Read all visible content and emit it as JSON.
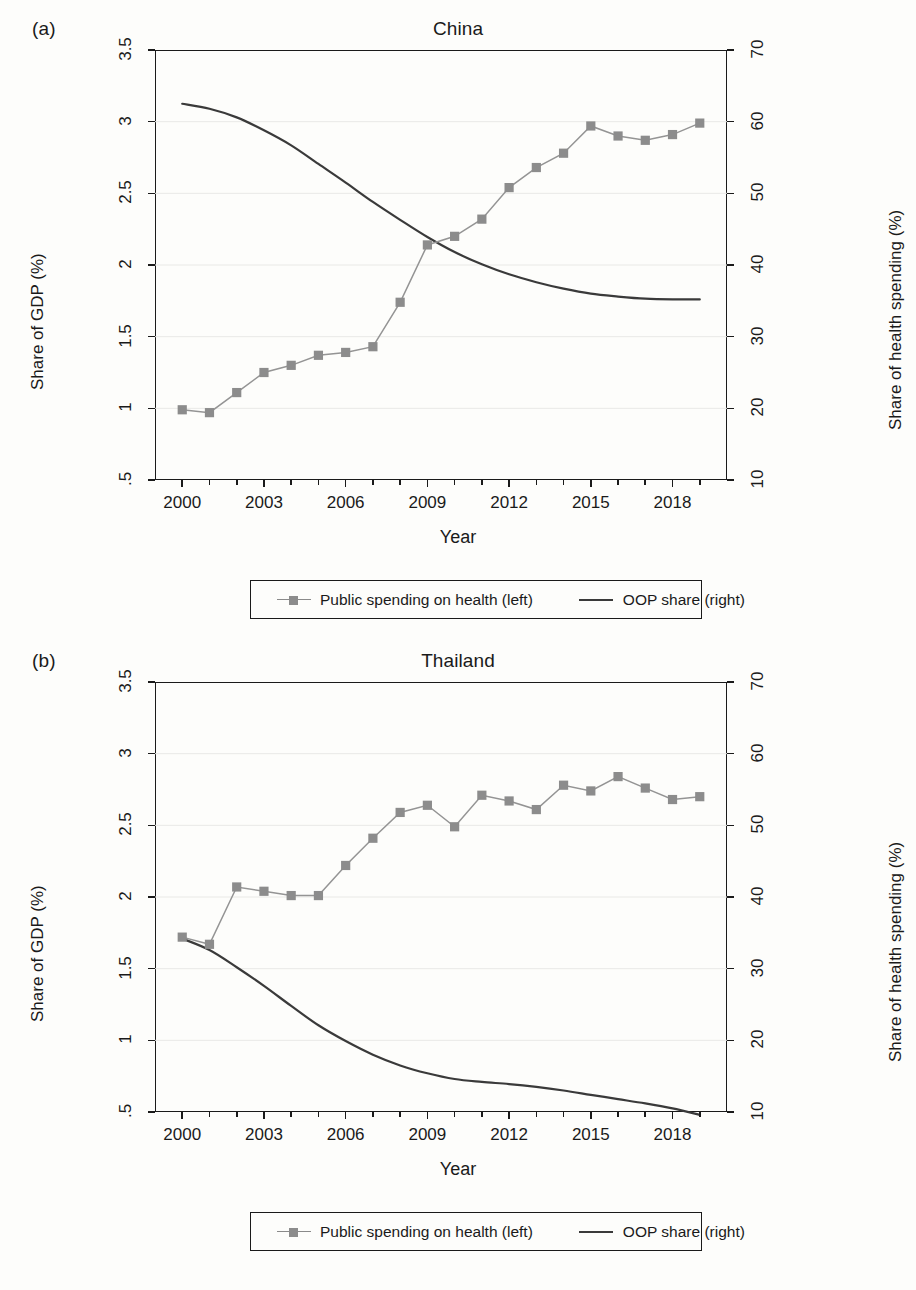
{
  "figure": {
    "panels": [
      {
        "letter": "(a)",
        "title": "China",
        "xlabel": "Year",
        "ylabel_left": "Share of GDP (%)",
        "ylabel_right": "Share of health spending (%)"
      },
      {
        "letter": "(b)",
        "title": "Thailand",
        "xlabel": "Year",
        "ylabel_left": "Share of GDP (%)",
        "ylabel_right": "Share of health spending (%)"
      }
    ],
    "legend": {
      "series1_label": "Public spending on health (left)",
      "series2_label": "OOP share (right)"
    },
    "colors": {
      "marker": "#8c8c8c",
      "series1_line": "#949494",
      "series2_line": "#3a3a3a",
      "axis": "#1a1a1a",
      "grid": "#e9e9e6"
    }
  },
  "chart_data": [
    {
      "type": "line",
      "title": "China",
      "panel": "(a)",
      "xlabel": "Year",
      "ylabel": "Share of GDP (%)",
      "ylabel_right": "Share of health spending (%)",
      "xlim": [
        1999,
        2020
      ],
      "ylim_left": [
        0.5,
        3.5
      ],
      "ylim_right": [
        10,
        70
      ],
      "ytick_labels_left": [
        "3.5",
        "3",
        "2.5",
        "2",
        "1.5",
        "1",
        ".5"
      ],
      "ytick_values_left": [
        3.5,
        3,
        2.5,
        2,
        1.5,
        1,
        0.5
      ],
      "ytick_labels_right": [
        "70",
        "60",
        "50",
        "40",
        "30",
        "20",
        "10"
      ],
      "ytick_values_right": [
        70,
        60,
        50,
        40,
        30,
        20,
        10
      ],
      "xtick_labels": [
        "2000",
        "2003",
        "2006",
        "2009",
        "2012",
        "2015",
        "2018"
      ],
      "xtick_values": [
        2000,
        2003,
        2006,
        2009,
        2012,
        2015,
        2018
      ],
      "grid": "horizontal",
      "legend_position": "below",
      "x": [
        2000,
        2001,
        2002,
        2003,
        2004,
        2005,
        2006,
        2007,
        2008,
        2009,
        2010,
        2011,
        2012,
        2013,
        2014,
        2015,
        2016,
        2017,
        2018,
        2019
      ],
      "series": [
        {
          "name": "Public spending on health (left)",
          "axis": "left",
          "marker": "square",
          "values": [
            0.99,
            0.97,
            1.11,
            1.25,
            1.3,
            1.37,
            1.39,
            1.43,
            1.74,
            2.14,
            2.2,
            2.32,
            2.54,
            2.68,
            2.78,
            2.97,
            2.9,
            2.87,
            2.91,
            2.99
          ]
        },
        {
          "name": "OOP share (right)",
          "axis": "right",
          "marker": "none",
          "values": [
            62.5,
            61.8,
            60.6,
            58.8,
            56.7,
            54.1,
            51.5,
            48.8,
            46.3,
            43.9,
            41.8,
            40.1,
            38.7,
            37.6,
            36.7,
            36.0,
            35.6,
            35.3,
            35.2,
            35.2
          ]
        }
      ]
    },
    {
      "type": "line",
      "title": "Thailand",
      "panel": "(b)",
      "xlabel": "Year",
      "ylabel": "Share of GDP (%)",
      "ylabel_right": "Share of health spending (%)",
      "xlim": [
        1999,
        2020
      ],
      "ylim_left": [
        0.5,
        3.5
      ],
      "ylim_right": [
        10,
        70
      ],
      "ytick_labels_left": [
        "3.5",
        "3",
        "2.5",
        "2",
        "1.5",
        "1",
        ".5"
      ],
      "ytick_values_left": [
        3.5,
        3,
        2.5,
        2,
        1.5,
        1,
        0.5
      ],
      "ytick_labels_right": [
        "70",
        "60",
        "50",
        "40",
        "30",
        "20",
        "10"
      ],
      "ytick_values_right": [
        70,
        60,
        50,
        40,
        30,
        20,
        10
      ],
      "xtick_labels": [
        "2000",
        "2003",
        "2006",
        "2009",
        "2012",
        "2015",
        "2018"
      ],
      "xtick_values": [
        2000,
        2003,
        2006,
        2009,
        2012,
        2015,
        2018
      ],
      "grid": "horizontal",
      "legend_position": "below",
      "x": [
        2000,
        2001,
        2002,
        2003,
        2004,
        2005,
        2006,
        2007,
        2008,
        2009,
        2010,
        2011,
        2012,
        2013,
        2014,
        2015,
        2016,
        2017,
        2018,
        2019
      ],
      "series": [
        {
          "name": "Public spending on health (left)",
          "axis": "left",
          "marker": "square",
          "values": [
            1.72,
            1.67,
            2.07,
            2.04,
            2.01,
            2.01,
            2.22,
            2.41,
            2.59,
            2.64,
            2.49,
            2.71,
            2.67,
            2.61,
            2.78,
            2.74,
            2.84,
            2.76,
            2.68,
            2.7
          ]
        },
        {
          "name": "OOP share (right)",
          "axis": "right",
          "marker": "none",
          "values": [
            34.2,
            32.6,
            30.2,
            27.6,
            24.8,
            22.1,
            19.9,
            18.0,
            16.5,
            15.4,
            14.6,
            14.2,
            13.9,
            13.5,
            13.0,
            12.4,
            11.8,
            11.2,
            10.5,
            9.6
          ]
        }
      ]
    }
  ]
}
